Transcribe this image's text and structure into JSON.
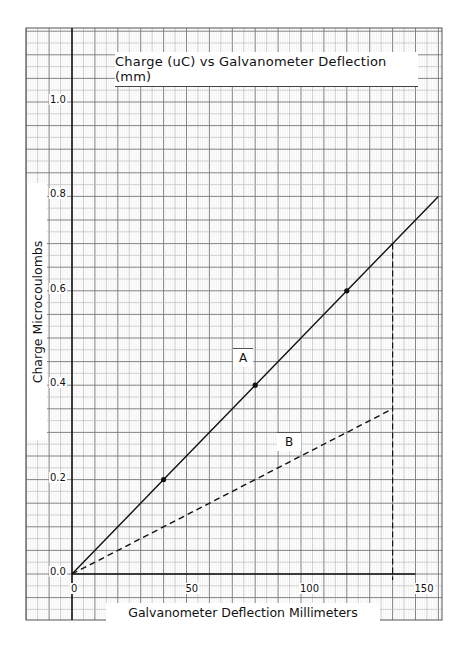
{
  "chart_data": {
    "type": "line",
    "title": "Charge (uC) vs Galvanometer Deflection (mm)",
    "xlabel": "Galvanometer Deflection Millimeters",
    "ylabel": "Charge Microcoulombs",
    "xlim": [
      0,
      160
    ],
    "ylim": [
      0,
      1.1
    ],
    "x_ticks": [
      "0",
      "50",
      "100",
      "150"
    ],
    "y_ticks": [
      "0.0",
      "0.2",
      "0.4",
      "0.6",
      "0.8",
      "1.0"
    ],
    "grid": true,
    "grid_style": "graph paper (minor 5 mm / 0.025 uC)",
    "series": [
      {
        "name": "A",
        "style": "solid",
        "x": [
          0,
          40,
          80,
          120,
          160
        ],
        "y": [
          0.0,
          0.2,
          0.4,
          0.6,
          0.8
        ],
        "markers": [
          [
            40,
            0.2
          ],
          [
            80,
            0.4
          ],
          [
            120,
            0.6
          ]
        ]
      },
      {
        "name": "B",
        "style": "dashed",
        "x": [
          0,
          140
        ],
        "y": [
          0.0,
          0.35
        ]
      }
    ],
    "annotations": [
      {
        "type": "vertical-dashed-line",
        "x": 140,
        "y_from": 0.0,
        "y_to": 0.7
      }
    ]
  }
}
